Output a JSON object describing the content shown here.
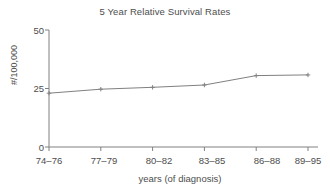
{
  "chart_data": {
    "type": "line",
    "title": "5 Year Relative Survival Rates",
    "xlabel": "years (of diagnosis)",
    "ylabel": "#/100,000",
    "categories": [
      "74–76",
      "77–79",
      "80–82",
      "83–85",
      "86–88",
      "89–95"
    ],
    "values": [
      23,
      24.7,
      25.5,
      26.5,
      30.5,
      30.8
    ],
    "ylim": [
      0,
      50
    ],
    "yticks": [
      0,
      25,
      50
    ],
    "ytick_labels": [
      "0",
      "25",
      "50"
    ],
    "grid": false,
    "legend": false,
    "marker": "plus",
    "line_color": "#808080",
    "text_color": "#4d4d4d",
    "background": "#ffffff"
  },
  "axes": {
    "y_tick_0": "0",
    "y_tick_1": "25",
    "y_tick_2": "50",
    "x_tick_0": "74–76",
    "x_tick_1": "77–79",
    "x_tick_2": "80–82",
    "x_tick_3": "83–85",
    "x_tick_4": "86–88",
    "x_tick_5": "89–95"
  }
}
